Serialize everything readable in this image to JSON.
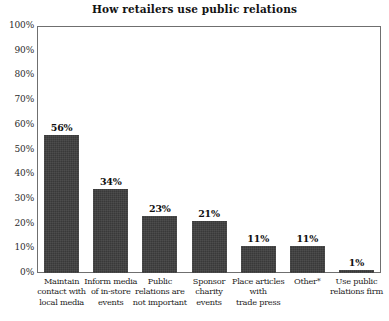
{
  "chart_data": {
    "type": "bar",
    "title": "How retailers use public relations",
    "xlabel": "",
    "ylabel": "",
    "ylim": [
      0,
      100
    ],
    "grid": false,
    "legend": "none",
    "y_tick_labels": [
      "100%",
      "90%",
      "80%",
      "70%",
      "60%",
      "50%",
      "40%",
      "30%",
      "20%",
      "10%",
      "0%"
    ],
    "y_tick_values": [
      100,
      90,
      80,
      70,
      60,
      50,
      40,
      30,
      20,
      10,
      0
    ],
    "categories": [
      "Maintain contact with local media",
      "Inform media of in-store events",
      "Public relations are not important",
      "Sponsor charity events",
      "Place articles with trade press",
      "Other*",
      "Use public relations firm"
    ],
    "category_lines": [
      [
        "Maintain",
        "contact with",
        "local media"
      ],
      [
        "Inform media",
        "of in-store",
        "events"
      ],
      [
        "Public",
        "relations are",
        "not important"
      ],
      [
        "Sponsor",
        "charity",
        "events"
      ],
      [
        "Place articles",
        "with",
        "trade press"
      ],
      [
        "Other*"
      ],
      [
        "Use public",
        "relations firm"
      ]
    ],
    "values": [
      56,
      34,
      23,
      21,
      11,
      11,
      1
    ],
    "value_labels": [
      "56%",
      "34%",
      "23%",
      "21%",
      "11%",
      "11%",
      "1%"
    ],
    "bar_color": "#393939",
    "axis_color": "#6f6f6f",
    "text_color": "#1a1a1a",
    "background_color": "#ffffff"
  }
}
